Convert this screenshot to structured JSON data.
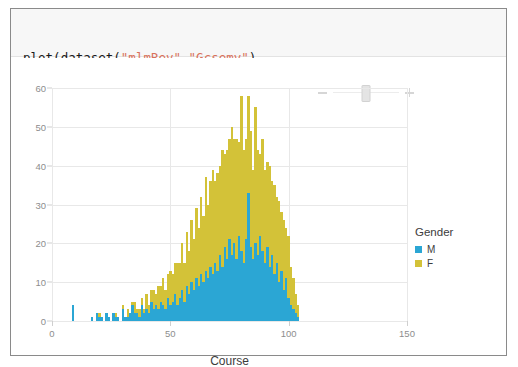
{
  "code": {
    "line1": [
      {
        "t": "plot(dataset(",
        "c": "plain"
      },
      {
        "t": "\"mlmRev\"",
        "c": "str"
      },
      {
        "t": ",",
        "c": "plain"
      },
      {
        "t": "\"Gcsemv\"",
        "c": "str"
      },
      {
        "t": "),",
        "c": "plain"
      }
    ],
    "line2": [
      {
        "t": "    x=",
        "c": "plain"
      },
      {
        "t": "\"Course\"",
        "c": "str"
      },
      {
        "t": ", color=",
        "c": "plain"
      },
      {
        "t": "\"Gender\"",
        "c": "str"
      },
      {
        "t": ", Geom.histogram)",
        "c": "plain"
      }
    ],
    "string_color": "#d9715a",
    "text_color": "#1a1a1a",
    "background": "#f7f7f7"
  },
  "toolbar": {
    "zoom_out_label": "-",
    "zoom_in_label": "+",
    "slider_position_pct": 50
  },
  "legend": {
    "title": "Gender",
    "entries": [
      {
        "label": "M",
        "color": "#2ba6d4"
      },
      {
        "label": "F",
        "color": "#d3c238"
      }
    ]
  },
  "chart_data": {
    "type": "bar",
    "subtype": "stacked-histogram",
    "title": "",
    "xlabel": "Course",
    "ylabel": "",
    "xlim": [
      0,
      150
    ],
    "ylim": [
      0,
      60
    ],
    "xticks": [
      0,
      50,
      100,
      150
    ],
    "yticks": [
      0,
      10,
      20,
      30,
      40,
      50,
      60
    ],
    "grid": true,
    "legend_position": "right",
    "bin_width": 1,
    "series": [
      {
        "name": "M",
        "color": "#2ba6d4"
      },
      {
        "name": "F",
        "color": "#d3c238"
      }
    ],
    "bins": [
      {
        "x": 9,
        "M": 4,
        "F": 0
      },
      {
        "x": 17,
        "M": 1,
        "F": 0
      },
      {
        "x": 19,
        "M": 2,
        "F": 0
      },
      {
        "x": 20,
        "M": 1,
        "F": 1
      },
      {
        "x": 21,
        "M": 1,
        "F": 0
      },
      {
        "x": 23,
        "M": 2,
        "F": 0
      },
      {
        "x": 24,
        "M": 1,
        "F": 0
      },
      {
        "x": 26,
        "M": 2,
        "F": 0
      },
      {
        "x": 27,
        "M": 1,
        "F": 1
      },
      {
        "x": 28,
        "M": 1,
        "F": 0
      },
      {
        "x": 30,
        "M": 3,
        "F": 1
      },
      {
        "x": 31,
        "M": 1,
        "F": 0
      },
      {
        "x": 32,
        "M": 1,
        "F": 2
      },
      {
        "x": 33,
        "M": 2,
        "F": 0
      },
      {
        "x": 34,
        "M": 4,
        "F": 1
      },
      {
        "x": 35,
        "M": 2,
        "F": 3
      },
      {
        "x": 36,
        "M": 2,
        "F": 1
      },
      {
        "x": 37,
        "M": 1,
        "F": 2
      },
      {
        "x": 38,
        "M": 4,
        "F": 2
      },
      {
        "x": 39,
        "M": 2,
        "F": 1
      },
      {
        "x": 40,
        "M": 3,
        "F": 4
      },
      {
        "x": 41,
        "M": 2,
        "F": 2
      },
      {
        "x": 42,
        "M": 5,
        "F": 3
      },
      {
        "x": 43,
        "M": 3,
        "F": 5
      },
      {
        "x": 44,
        "M": 4,
        "F": 3
      },
      {
        "x": 45,
        "M": 3,
        "F": 6
      },
      {
        "x": 46,
        "M": 5,
        "F": 4
      },
      {
        "x": 47,
        "M": 4,
        "F": 7
      },
      {
        "x": 48,
        "M": 3,
        "F": 5
      },
      {
        "x": 49,
        "M": 6,
        "F": 6
      },
      {
        "x": 50,
        "M": 4,
        "F": 9
      },
      {
        "x": 51,
        "M": 5,
        "F": 7
      },
      {
        "x": 52,
        "M": 7,
        "F": 8
      },
      {
        "x": 53,
        "M": 4,
        "F": 11
      },
      {
        "x": 54,
        "M": 6,
        "F": 9
      },
      {
        "x": 55,
        "M": 8,
        "F": 12
      },
      {
        "x": 56,
        "M": 5,
        "F": 10
      },
      {
        "x": 57,
        "M": 9,
        "F": 14
      },
      {
        "x": 58,
        "M": 7,
        "F": 11
      },
      {
        "x": 59,
        "M": 10,
        "F": 16
      },
      {
        "x": 60,
        "M": 8,
        "F": 13
      },
      {
        "x": 61,
        "M": 11,
        "F": 18
      },
      {
        "x": 62,
        "M": 9,
        "F": 15
      },
      {
        "x": 63,
        "M": 12,
        "F": 20
      },
      {
        "x": 64,
        "M": 10,
        "F": 17
      },
      {
        "x": 65,
        "M": 13,
        "F": 24
      },
      {
        "x": 66,
        "M": 11,
        "F": 19
      },
      {
        "x": 67,
        "M": 14,
        "F": 22
      },
      {
        "x": 68,
        "M": 12,
        "F": 27
      },
      {
        "x": 69,
        "M": 15,
        "F": 21
      },
      {
        "x": 70,
        "M": 13,
        "F": 25
      },
      {
        "x": 71,
        "M": 17,
        "F": 23
      },
      {
        "x": 72,
        "M": 14,
        "F": 30
      },
      {
        "x": 73,
        "M": 19,
        "F": 24
      },
      {
        "x": 74,
        "M": 16,
        "F": 28
      },
      {
        "x": 75,
        "M": 21,
        "F": 26
      },
      {
        "x": 76,
        "M": 17,
        "F": 33
      },
      {
        "x": 77,
        "M": 20,
        "F": 27
      },
      {
        "x": 78,
        "M": 16,
        "F": 31
      },
      {
        "x": 79,
        "M": 22,
        "F": 24
      },
      {
        "x": 80,
        "M": 18,
        "F": 40
      },
      {
        "x": 81,
        "M": 15,
        "F": 29
      },
      {
        "x": 82,
        "M": 21,
        "F": 26
      },
      {
        "x": 83,
        "M": 33,
        "F": 25
      },
      {
        "x": 84,
        "M": 19,
        "F": 30
      },
      {
        "x": 85,
        "M": 16,
        "F": 23
      },
      {
        "x": 86,
        "M": 20,
        "F": 35
      },
      {
        "x": 87,
        "M": 17,
        "F": 27
      },
      {
        "x": 88,
        "M": 22,
        "F": 21
      },
      {
        "x": 89,
        "M": 18,
        "F": 29
      },
      {
        "x": 90,
        "M": 15,
        "F": 24
      },
      {
        "x": 91,
        "M": 19,
        "F": 22
      },
      {
        "x": 92,
        "M": 14,
        "F": 26
      },
      {
        "x": 93,
        "M": 17,
        "F": 19
      },
      {
        "x": 94,
        "M": 12,
        "F": 23
      },
      {
        "x": 95,
        "M": 15,
        "F": 17
      },
      {
        "x": 96,
        "M": 10,
        "F": 21
      },
      {
        "x": 97,
        "M": 13,
        "F": 15
      },
      {
        "x": 98,
        "M": 8,
        "F": 18
      },
      {
        "x": 99,
        "M": 11,
        "F": 13
      },
      {
        "x": 100,
        "M": 6,
        "F": 16
      },
      {
        "x": 101,
        "M": 4,
        "F": 10
      },
      {
        "x": 102,
        "M": 3,
        "F": 8
      },
      {
        "x": 103,
        "M": 2,
        "F": 5
      },
      {
        "x": 104,
        "M": 1,
        "F": 3
      }
    ]
  }
}
